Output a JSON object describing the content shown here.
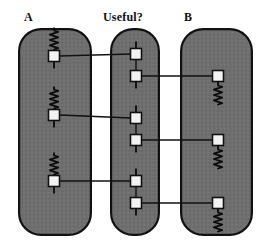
{
  "figure": {
    "type": "diagram",
    "width": 271,
    "height": 249,
    "background": "#ffffff"
  },
  "style": {
    "group_fill": "#6e6e6e",
    "group_stroke": "#111111",
    "group_stroke_width": 2.2,
    "group_corner_radius": 22,
    "node_fill": "#f2f2f2",
    "node_stroke": "#111111",
    "node_stroke_width": 1.6,
    "node_size": 11,
    "link_stroke": "#111111",
    "link_stroke_width": 1.4,
    "spring_stroke": "#0b0b0b",
    "spring_stroke_width": 1.8,
    "label_color": "#111111"
  },
  "columns": [
    {
      "id": "a",
      "label": "A",
      "label_x": 24,
      "label_y": 11,
      "box": {
        "x": 18,
        "y": 28,
        "w": 74,
        "h": 208
      },
      "node_x": 54,
      "spring_position": "above",
      "nodes": [
        {
          "id": "a1",
          "y": 56
        },
        {
          "id": "a2",
          "y": 115
        },
        {
          "id": "a3",
          "y": 181
        }
      ]
    },
    {
      "id": "useful",
      "label": "Useful?",
      "label_x": 103,
      "label_y": 11,
      "box": {
        "x": 110,
        "y": 28,
        "w": 50,
        "h": 208
      },
      "node_x": 136,
      "spring_position": "none",
      "nodes": [
        {
          "id": "m1",
          "y": 54
        },
        {
          "id": "m2",
          "y": 76
        },
        {
          "id": "m3",
          "y": 118
        },
        {
          "id": "m4",
          "y": 140
        },
        {
          "id": "m5",
          "y": 181
        },
        {
          "id": "m6",
          "y": 203
        }
      ],
      "pairs": [
        {
          "from": "m1",
          "to": "m2"
        },
        {
          "from": "m3",
          "to": "m4"
        },
        {
          "from": "m5",
          "to": "m6"
        }
      ]
    },
    {
      "id": "b",
      "label": "B",
      "label_x": 184,
      "label_y": 11,
      "box": {
        "x": 180,
        "y": 28,
        "w": 73,
        "h": 208
      },
      "node_x": 218,
      "spring_position": "below",
      "nodes": [
        {
          "id": "b1",
          "y": 76
        },
        {
          "id": "b2",
          "y": 140
        },
        {
          "id": "b3",
          "y": 203
        }
      ]
    }
  ],
  "links": [
    {
      "id": "link-a1-m1",
      "from": "a1",
      "to": "m1",
      "x1": 60,
      "y1": 56,
      "x2": 130,
      "y2": 54
    },
    {
      "id": "link-a2-m3",
      "from": "a2",
      "to": "m3",
      "x1": 60,
      "y1": 115,
      "x2": 130,
      "y2": 118
    },
    {
      "id": "link-a3-m5",
      "from": "a3",
      "to": "m5",
      "x1": 60,
      "y1": 181,
      "x2": 130,
      "y2": 181
    },
    {
      "id": "link-m2-b1",
      "from": "m2",
      "to": "b1",
      "x1": 142,
      "y1": 76,
      "x2": 212,
      "y2": 76
    },
    {
      "id": "link-m4-b2",
      "from": "m4",
      "to": "b2",
      "x1": 142,
      "y1": 140,
      "x2": 212,
      "y2": 140
    },
    {
      "id": "link-m6-b3",
      "from": "m6",
      "to": "b3",
      "x1": 142,
      "y1": 203,
      "x2": 212,
      "y2": 203
    }
  ]
}
